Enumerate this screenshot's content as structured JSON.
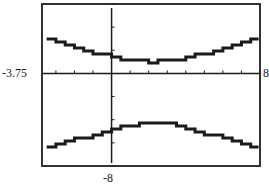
{
  "chart_data": {
    "type": "line",
    "title": "",
    "xlabel": "",
    "ylabel": "",
    "window_labels": {
      "xmin": "-3.75",
      "xmax": "8",
      "ymin": "-8"
    },
    "xlim": [
      -3.75,
      8
    ],
    "ylim": [
      -8,
      6
    ],
    "xscale": 1,
    "yscale": 1,
    "grid": false,
    "legend": null,
    "style": "calculator step-plot",
    "series": [
      {
        "name": "upper branch",
        "x": [
          -3.5,
          -3,
          -2,
          -1,
          0,
          1,
          2,
          2.2,
          3,
          4,
          5,
          6,
          7,
          7.6
        ],
        "values": [
          2.9,
          2.7,
          2.2,
          1.8,
          1.3,
          1.1,
          1.0,
          1.0,
          1.1,
          1.4,
          1.8,
          2.3,
          2.7,
          2.9
        ]
      },
      {
        "name": "lower branch",
        "x": [
          -3.5,
          -3,
          -2,
          -1,
          0,
          1,
          2,
          2.2,
          3,
          4,
          5,
          6,
          7,
          7.6
        ],
        "values": [
          -6.4,
          -6.2,
          -5.7,
          -5.3,
          -4.8,
          -4.5,
          -4.3,
          -4.3,
          -4.4,
          -4.8,
          -5.2,
          -5.7,
          -6.2,
          -6.4
        ]
      }
    ]
  },
  "colors": {
    "ink": "#1a1a1a",
    "frame": "#333333",
    "background": "#ffffff"
  }
}
